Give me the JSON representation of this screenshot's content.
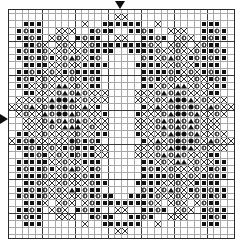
{
  "chart": {
    "type": "cross-stitch-grid",
    "columns": 34,
    "rows": 34,
    "bold_line_every": 5,
    "cell_size_px": 6.6,
    "grid_color": "#a8a8a8",
    "bold_grid_color": "#3a3a3a",
    "border_color": "#2b2b2b",
    "symbol_color": "#101010",
    "background": "#ffffff",
    "markers": {
      "top_center_label": "center-marker-top",
      "top_center_glyph": "▼",
      "top_center_column": 17,
      "left_center_label": "center-marker-left",
      "left_center_glyph": "▶",
      "left_center_row": 17
    },
    "legend": [
      {
        "key": "sq",
        "glyph": "■",
        "name": "filled-square"
      },
      {
        "key": "mo",
        "glyph": "◑",
        "name": "half-moon"
      },
      {
        "key": "ci",
        "glyph": "○",
        "name": "open-circle"
      },
      {
        "key": "fc",
        "glyph": "●",
        "name": "filled-circle"
      },
      {
        "key": "tr",
        "glyph": "▲",
        "name": "filled-triangle"
      },
      {
        "key": "x",
        "glyph": "×",
        "name": "cross-mark"
      }
    ],
    "cells": [
      "..................................",
      ".................x................",
      "..sq.sq.sq.......x......sq.sq.sq..",
      ".sq.mo.sq.sq...x.x.x...sq.mo.sq.sq",
      ".sq.sq.mo.sq..x.mo.x..sq.mo.sq.sq.",
      "..sq.sq.mo.x..x.mo.x..x.mo.sq.sq..",
      "...sq.sq.mo.x.x.mo.x.x.mo.sq.sq...",
      "....sq.mo.sq.x.mo.tr.mo.x.sq.mo...",
      "...sq.sq.sq.x.x.mo.x.x.sq.sq.sq...",
      ".sq.sq.mo.sq.x.mo.x.sq.mo.sq.sq.sq",
      ".sq.mo.sq.x.mo.x.x.x.mo.x.sq.mo.sq",
      ".sq.sq.x.x.mo.x.tr.tr.x.mo.x.sq.sq",
      "....x.x.x.mo.tr.mo.tr.mo.x.x.x....",
      ".x.x.x.mo.x.tr.fc.fc.tr.x.mo.x.x.x",
      "x.x.mo.tr.x.mo.fc.mo.fc.mo.x.tr.x.",
      ".x.mo.x.x.tr.mo.fc.fc.tr.mo.x.x.x.",
      "..x.x.x.mo.tr.mo.tr.mo.tr.mo.x.x..",
      "....x.x.mo.x.tr.tr.tr.x.mo.x.x....",
      ".sq.sq.x.x.mo.x.x.x.x.mo.x.x.sq.sq",
      ".sq.mo.fc.x.x.x.x.x.fc.mo.sq.mo.sq",
      ".sq.sq.mo.sq.x.mo.x.sq.mo.sq.sq.sq",
      "..sq.sq.mo.sq.x.mo.x.sq.mo.sq.sq..",
      "...sq.sq.sq.x.x.mo.x.x.sq.sq.sq...",
      "....sq.mo.sq.x.mo.tr.mo.x.sq.mo...",
      "...sq.sq.mo.x.x.mo.x.x.mo.sq.sq...",
      "..sq.sq.mo.x..x.mo.x..x.mo.sq.sq..",
      ".sq.sq.mo.sq..x.mo.x..sq.mo.sq.sq.",
      ".sq.mo.sq.sq...x.x.x...sq.mo.sq.sq",
      "..sq.sq.sq.......x......sq.sq.sq..",
      ".................x................",
      ".................................."
    ]
  }
}
